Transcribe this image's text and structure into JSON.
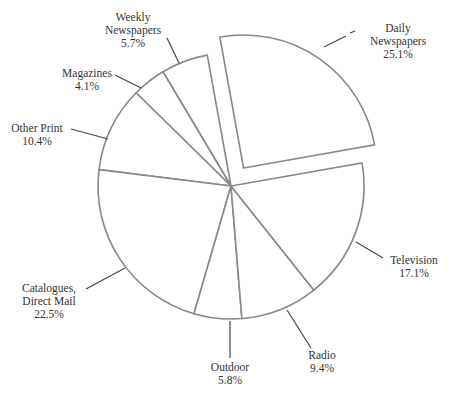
{
  "chart_data": {
    "type": "pie",
    "title": "",
    "exploded": [
      "Daily Newspapers"
    ],
    "categories": [
      "Daily Newspapers",
      "Weekly Newspapers",
      "Magazines",
      "Other Print",
      "Catalogues, Direct Mail",
      "Outdoor",
      "Radio",
      "Television"
    ],
    "values": [
      25.1,
      5.7,
      4.1,
      10.4,
      22.5,
      5.8,
      9.4,
      17.1
    ],
    "unit": "%",
    "legend": "none (direct labels with leader lines)"
  },
  "labels": [
    {
      "id": "daily",
      "lines": [
        "Daily",
        "Newspapers"
      ],
      "value": "25.1%",
      "x": 398,
      "y": 26
    },
    {
      "id": "weekly",
      "lines": [
        "Weekly",
        "Newspapers"
      ],
      "value": "5.7%",
      "x": 133,
      "y": 15
    },
    {
      "id": "magazines",
      "lines": [
        "Magazines"
      ],
      "value": "4.1%",
      "x": 87,
      "y": 71
    },
    {
      "id": "otherprint",
      "lines": [
        "Other Print"
      ],
      "value": "10.4%",
      "x": 37,
      "y": 124
    },
    {
      "id": "catalogues",
      "lines": [
        "Catalogues,",
        "Direct Mail"
      ],
      "value": "22.5%",
      "x": 49,
      "y": 283
    },
    {
      "id": "outdoor",
      "lines": [
        "Outdoor"
      ],
      "value": "5.8%",
      "x": 230,
      "y": 362
    },
    {
      "id": "radio",
      "lines": [
        "Radio"
      ],
      "value": "9.4%",
      "x": 322,
      "y": 348
    },
    {
      "id": "television",
      "lines": [
        "Television"
      ],
      "value": "17.1%",
      "x": 414,
      "y": 256
    }
  ],
  "geometry": {
    "cx": 231,
    "cy": 186,
    "r": 133,
    "start_angle_deg": -10,
    "explode_offset": 22
  },
  "colors": {
    "slice_fill": "#ffffff",
    "slice_stroke": "#888888",
    "leader": "#444444",
    "text": "#333333"
  }
}
